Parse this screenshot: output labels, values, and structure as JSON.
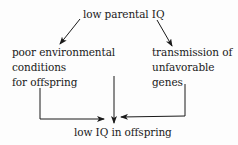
{
  "diagram": {
    "top_node": "low parental IQ",
    "left_node": [
      "poor environmental",
      "conditions",
      "for offspring"
    ],
    "right_node": [
      "transmission of",
      "unfavorable",
      "genes"
    ],
    "bottom_node": "low IQ in offspring",
    "line_color": "#1a1a1a"
  }
}
